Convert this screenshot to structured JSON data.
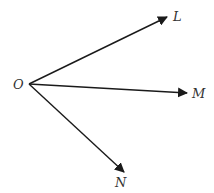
{
  "diagram": {
    "type": "vectors-from-point",
    "stroke_color": "#1a1a1a",
    "label_color": "#333333",
    "origin": {
      "label": "O",
      "x": 29,
      "y": 84,
      "label_x": 13,
      "label_y": 89
    },
    "vectors": [
      {
        "label": "L",
        "x1": 29,
        "y1": 84,
        "x2": 167,
        "y2": 17,
        "label_x": 173,
        "label_y": 21
      },
      {
        "label": "M",
        "x1": 29,
        "y1": 84,
        "x2": 187,
        "y2": 93,
        "label_x": 192,
        "label_y": 98
      },
      {
        "label": "N",
        "x1": 29,
        "y1": 84,
        "x2": 124,
        "y2": 172,
        "label_x": 115,
        "label_y": 187
      }
    ]
  }
}
